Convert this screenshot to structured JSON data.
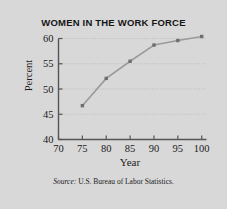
{
  "chart_data": {
    "type": "line",
    "title": "WOMEN IN THE WORK FORCE",
    "xlabel": "Year",
    "ylabel": "Percent",
    "source": "Source: U.S. Bureau of Labor Statistics.",
    "source_lead": "Source:",
    "source_rest": " U.S. Bureau of Labor Statistics.",
    "x": [
      75,
      80,
      85,
      90,
      95,
      100
    ],
    "values": [
      46.7,
      52.1,
      55.5,
      58.7,
      59.6,
      60.4
    ],
    "series": [
      {
        "name": "Percent of women in the work force",
        "values": [
          46.7,
          52.1,
          55.5,
          58.7,
          59.6,
          60.4
        ]
      }
    ],
    "xlim": [
      70,
      101
    ],
    "ylim": [
      40,
      60.8
    ],
    "xticks": [
      70,
      75,
      80,
      85,
      90,
      95,
      100
    ],
    "xtick_labels": [
      "70",
      "75",
      "80",
      "85",
      "90",
      "95",
      "100"
    ],
    "yticks": [
      40,
      45,
      50,
      55,
      60
    ],
    "ytick_labels": [
      "40",
      "45",
      "50",
      "55",
      "60"
    ],
    "grid": "horizontal-dotted",
    "legend": null,
    "marker": "square",
    "line_color": "#9a9a9a",
    "marker_color": "#6e6e6e",
    "grid_color": "#b9b9b9",
    "axis_color": "#555555",
    "background_color": "#d8d8d8"
  }
}
